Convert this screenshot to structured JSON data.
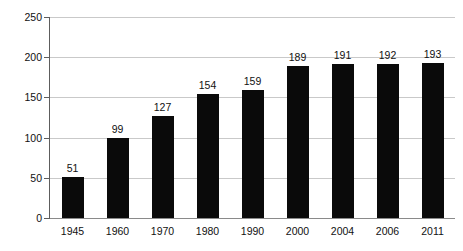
{
  "chart_data": {
    "type": "bar",
    "title": "",
    "xlabel": "",
    "ylabel": "Number of Member States",
    "categories": [
      "1945",
      "1960",
      "1970",
      "1980",
      "1990",
      "2000",
      "2004",
      "2006",
      "2011"
    ],
    "values": [
      51,
      99,
      127,
      154,
      159,
      189,
      191,
      192,
      193
    ],
    "value_labels": [
      "51",
      "99",
      "127",
      "154",
      "159",
      "189",
      "191",
      "192",
      "193"
    ],
    "ylim": [
      0,
      250
    ],
    "yticks": [
      0,
      50,
      100,
      150,
      200,
      250
    ],
    "ytick_labels": [
      "0",
      "50",
      "100",
      "150",
      "200",
      "250"
    ],
    "grid": true,
    "legend": false,
    "legend_position": "none",
    "bar_color": "#0a0a0a",
    "gridline_color": "#c9c9c9",
    "axis_color": "#5d5d5d",
    "background_color": "#ffffff"
  }
}
